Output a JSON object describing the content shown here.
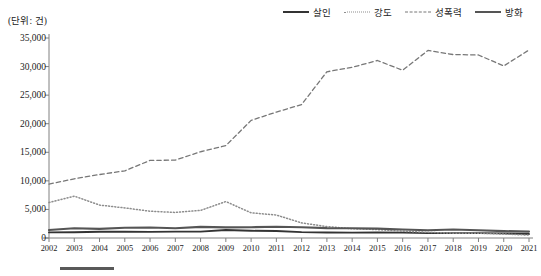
{
  "unit_label": "(단위: 건)",
  "legend": {
    "position": "top-right",
    "items": [
      {
        "label": "살인",
        "style": "solid",
        "color": "#333333",
        "icon": "legend-line-solid-icon"
      },
      {
        "label": "강도",
        "style": "dotted",
        "color": "#8d8d8d",
        "icon": "legend-line-dotted-icon"
      },
      {
        "label": "성폭력",
        "style": "dashed",
        "color": "#777777",
        "icon": "legend-line-dashed-icon"
      },
      {
        "label": "방화",
        "style": "solid",
        "color": "#555555",
        "icon": "legend-line-solid-icon"
      }
    ]
  },
  "chart_data": {
    "type": "line",
    "title": "",
    "xlabel": "",
    "ylabel": "",
    "unit": "(단위: 건)",
    "ylim": [
      0,
      35000
    ],
    "ytick_step": 5000,
    "grid": false,
    "legend_position": "top-right",
    "categories": [
      "2002",
      "2003",
      "2004",
      "2005",
      "2006",
      "2007",
      "2008",
      "2009",
      "2010",
      "2011",
      "2012",
      "2013",
      "2014",
      "2015",
      "2016",
      "2017",
      "2018",
      "2019",
      "2020",
      "2021"
    ],
    "ytick_labels": [
      "0",
      "5,000",
      "10,000",
      "15,000",
      "20,000",
      "25,000",
      "30,000",
      "35,000"
    ],
    "ytick_values": [
      0,
      5000,
      10000,
      15000,
      20000,
      25000,
      30000,
      35000
    ],
    "series": [
      {
        "name": "살인",
        "style": "solid",
        "color": "#333333",
        "values": [
          983,
          1011,
          1082,
          1091,
          1064,
          1124,
          1120,
          1390,
          1262,
          1221,
          1022,
          959,
          938,
          958,
          948,
          858,
          849,
          847,
          805,
          692
        ]
      },
      {
        "name": "강도",
        "style": "dotted",
        "color": "#8d8d8d",
        "values": [
          6221,
          7327,
          5762,
          5266,
          4684,
          4470,
          4827,
          6379,
          4402,
          4021,
          2643,
          2001,
          1618,
          1472,
          1181,
          990,
          841,
          845,
          692,
          511
        ]
      },
      {
        "name": "성폭력",
        "style": "dashed",
        "color": "#777777",
        "values": [
          9435,
          10365,
          11105,
          11757,
          13573,
          13634,
          15094,
          16156,
          20584,
          22034,
          23365,
          29090,
          29863,
          31063,
          29357,
          32824,
          32104,
          32029,
          30105,
          32898
        ]
      },
      {
        "name": "방화",
        "style": "solid",
        "color": "#555555",
        "values": [
          1388,
          1713,
          1590,
          1801,
          1826,
          1694,
          1946,
          1866,
          1886,
          1972,
          1882,
          1730,
          1707,
          1646,
          1477,
          1358,
          1478,
          1345,
          1210,
          1124
        ]
      }
    ]
  }
}
